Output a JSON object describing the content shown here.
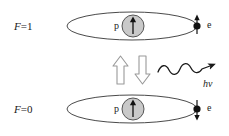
{
  "figure": {
    "background_color": "#ffffff",
    "width": 229,
    "height": 136
  },
  "colors": {
    "stroke": "#3a3a3a",
    "orbit_stroke": "#4a4a4a",
    "nucleus_fill": "#c9c9c9",
    "nucleus_stroke": "#555555",
    "electron_fill": "#111111",
    "block_arrow_fill": "#ffffff",
    "block_arrow_stroke": "#9a9a9a",
    "text": "#1a1a1a",
    "wave_stroke": "#1a1a1a"
  },
  "states": [
    {
      "id": "upper",
      "label_symbol": "F",
      "label_equals": "=",
      "label_value": "1",
      "nucleus_label": "p",
      "nucleus_spin": "up",
      "electron_label": "e",
      "electron_spin": "up",
      "description": "parallel spins"
    },
    {
      "id": "lower",
      "label_symbol": "F",
      "label_equals": "=",
      "label_value": "0",
      "nucleus_label": "p",
      "nucleus_spin": "up",
      "electron_label": "e",
      "electron_spin": "down",
      "description": "antiparallel spins"
    }
  ],
  "transition": {
    "up_arrow": {
      "name": "absorption-arrow",
      "direction": "up",
      "style": "hollow-block"
    },
    "down_arrow": {
      "name": "emission-arrow",
      "direction": "down",
      "style": "hollow-block"
    },
    "photon": {
      "label_h": "h",
      "label_nu": "ν",
      "label": "hν",
      "style": "wavy-arrow",
      "direction": "right",
      "cycles": 3
    }
  }
}
